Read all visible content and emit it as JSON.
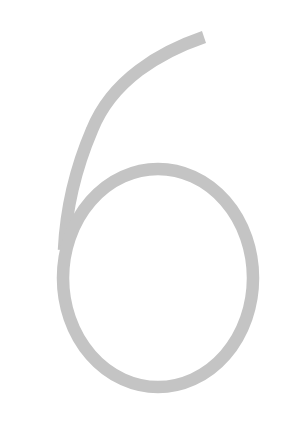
{
  "glyph": {
    "character": "6",
    "color": "#c4c4c4",
    "background": "#ffffff"
  }
}
